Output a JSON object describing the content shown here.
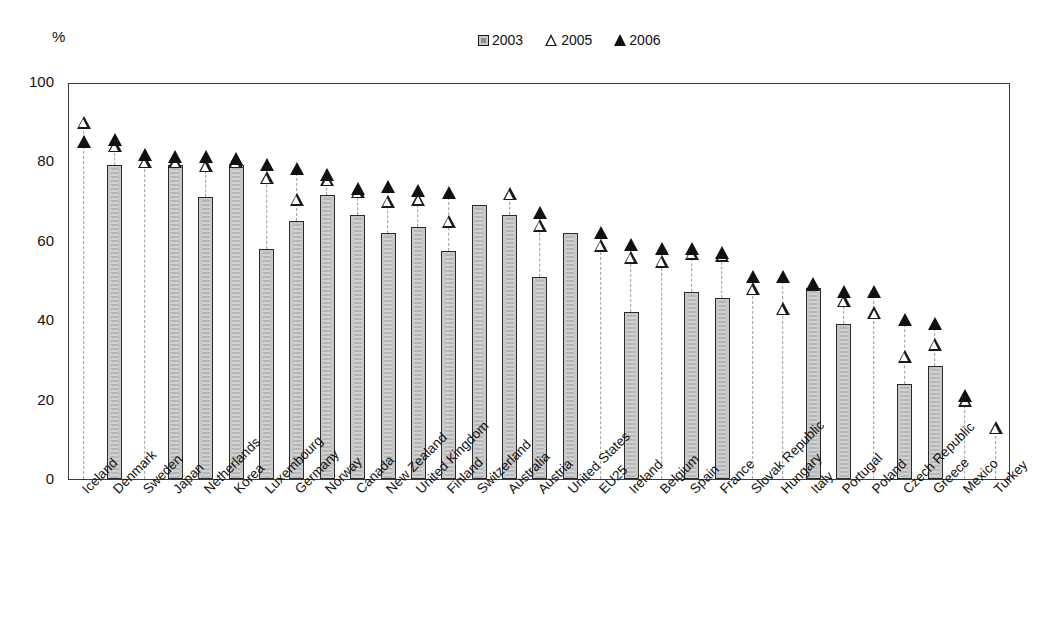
{
  "unit_label": "%",
  "legend": {
    "items": [
      {
        "key": "2003",
        "label": "2003",
        "marker": "filled-square-icon",
        "color": "#c9c9c9"
      },
      {
        "key": "2005",
        "label": "2005",
        "marker": "open-triangle-icon",
        "color": "#ffffff"
      },
      {
        "key": "2006",
        "label": "2006",
        "marker": "solid-triangle-icon",
        "color": "#111111"
      }
    ]
  },
  "axis": {
    "y_ticks": [
      "0",
      "20",
      "40",
      "60",
      "80",
      "100"
    ],
    "y_min": 0,
    "y_max": 100
  },
  "chart_data": {
    "type": "bar",
    "title": "",
    "subtitle": "",
    "xlabel": "",
    "ylabel": "%",
    "ylim": [
      0,
      100
    ],
    "ytick_values": [
      0,
      20,
      40,
      60,
      80,
      100
    ],
    "grid": false,
    "legend_position": "top-center",
    "annotations": [
      "Dashed vertical stems connect bar tops / baseline to the 2005 and 2006 markers."
    ],
    "categories": [
      "Iceland",
      "Denmark",
      "Sweden",
      "Japan",
      "Netherlands",
      "Korea",
      "Luxembourg",
      "Germany",
      "Norway",
      "Canada",
      "New Zealand",
      "United Kingdom",
      "Finland",
      "Switzerland",
      "Australia",
      "Austria",
      "United States",
      "EU25",
      "Ireland",
      "Belgium",
      "Spain",
      "France",
      "Slovak Republic",
      "Hungary",
      "Italy",
      "Portugal",
      "Poland",
      "Czech Republic",
      "Greece",
      "Mexico",
      "Turkey"
    ],
    "series": [
      {
        "name": "2003",
        "marker": "bar",
        "values": [
          null,
          79,
          null,
          79,
          71,
          79,
          58,
          65,
          71.5,
          66.5,
          62,
          63.5,
          57.5,
          69,
          66.5,
          51,
          62,
          null,
          42,
          null,
          47,
          45.5,
          null,
          null,
          48,
          39,
          null,
          24,
          28.5,
          null,
          null
        ]
      },
      {
        "name": "2005",
        "marker": "open-triangle",
        "values": [
          89,
          83,
          79,
          79,
          78,
          79,
          75,
          69.5,
          74.5,
          71.5,
          69,
          69.5,
          64,
          null,
          71,
          63,
          null,
          58,
          55,
          54,
          56,
          55.5,
          47,
          42,
          48,
          44,
          41,
          30,
          33,
          19,
          12
        ]
      },
      {
        "name": "2006",
        "marker": "solid-triangle",
        "values": [
          84,
          84.5,
          80.5,
          80,
          80,
          79.5,
          78,
          77,
          75.5,
          72,
          72.5,
          71.5,
          71,
          null,
          null,
          66,
          null,
          61,
          58,
          57,
          57,
          56,
          50,
          50,
          48,
          46,
          46,
          39,
          38,
          20,
          null
        ]
      }
    ]
  }
}
